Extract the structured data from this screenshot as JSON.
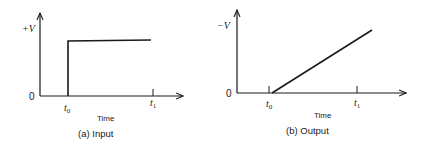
{
  "panels": [
    {
      "id": "a",
      "caption": "(a) Input",
      "y_label": "+V",
      "origin_label": "0",
      "x_label": "Time",
      "ticks": [
        {
          "label": "t",
          "sub": "0"
        },
        {
          "label": "t",
          "sub": "1"
        }
      ],
      "signal": "step"
    },
    {
      "id": "b",
      "caption": "(b) Output",
      "y_label": "−V",
      "origin_label": "0",
      "x_label": "Time",
      "ticks": [
        {
          "label": "t",
          "sub": "0"
        },
        {
          "label": "t",
          "sub": "1"
        }
      ],
      "signal": "ramp"
    }
  ],
  "colors": {
    "ink": "#1a1a1a",
    "background": "#ffffff"
  }
}
